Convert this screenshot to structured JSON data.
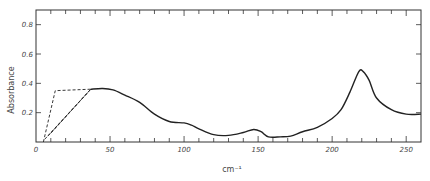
{
  "chart_data": {
    "type": "line",
    "title": "",
    "xlabel": "cm⁻¹",
    "ylabel": "Absorbance",
    "xlim": [
      0,
      260
    ],
    "ylim": [
      0,
      0.9
    ],
    "xticks": [
      0,
      50,
      100,
      150,
      200,
      250
    ],
    "xtick_labels": [
      "0",
      "50",
      "100",
      "150",
      "200",
      "250"
    ],
    "yticks": [
      0.2,
      0.4,
      0.6,
      0.8
    ],
    "ytick_labels": [
      "0.2",
      "0.4",
      "0.6",
      "0.8"
    ],
    "grid": false,
    "legend": null,
    "series": [
      {
        "name": "measured",
        "style": "solid",
        "x": [
          37,
          45,
          52,
          60,
          70,
          80,
          90,
          100,
          105,
          110,
          120,
          130,
          140,
          147,
          152,
          157,
          165,
          172,
          180,
          190,
          200,
          206,
          212,
          218,
          221,
          225,
          230,
          240,
          250,
          260
        ],
        "y": [
          0.36,
          0.365,
          0.355,
          0.32,
          0.27,
          0.19,
          0.14,
          0.13,
          0.115,
          0.09,
          0.05,
          0.045,
          0.065,
          0.085,
          0.07,
          0.035,
          0.035,
          0.04,
          0.07,
          0.1,
          0.16,
          0.22,
          0.34,
          0.48,
          0.48,
          0.42,
          0.3,
          0.22,
          0.19,
          0.19
        ]
      },
      {
        "name": "extrapolation-1",
        "style": "dashed",
        "x": [
          5,
          13,
          37
        ],
        "y": [
          0.0,
          0.35,
          0.36
        ]
      },
      {
        "name": "extrapolation-2",
        "style": "dashed",
        "x": [
          6,
          37
        ],
        "y": [
          0.02,
          0.36
        ]
      },
      {
        "name": "extrapolation-3",
        "style": "dashed",
        "x": [
          8,
          37
        ],
        "y": [
          0.04,
          0.36
        ]
      },
      {
        "name": "extrapolation-4",
        "style": "dashed",
        "x": [
          10,
          37
        ],
        "y": [
          0.06,
          0.36
        ]
      }
    ]
  },
  "colors": {
    "line": "#222222",
    "axis": "#333333",
    "text": "#444444",
    "background": "#ffffff"
  }
}
